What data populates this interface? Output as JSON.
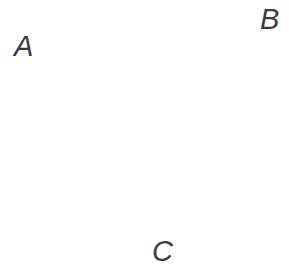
{
  "figure": {
    "type": "geometric-diagram",
    "shape": "triangle",
    "width": 289,
    "height": 279,
    "background_color": "#ffffff",
    "stroke_color": "#3a3a3f",
    "stroke_width": 2.2,
    "label_color": "#3a3a40",
    "label_font_size": 29,
    "label_style": "italic"
  },
  "vertices": {
    "A": {
      "label": "A",
      "x": 38,
      "y": 47
    },
    "B": {
      "label": "B",
      "x": 257,
      "y": 29
    },
    "C": {
      "label": "C",
      "x": 165,
      "y": 233
    }
  },
  "edges": [
    {
      "name": "AB",
      "from": "A",
      "to": "B"
    },
    {
      "name": "BC",
      "from": "B",
      "to": "C"
    },
    {
      "name": "CA",
      "from": "C",
      "to": "A"
    }
  ],
  "polygon_points": "38,47 257,29 165,233",
  "labels": {
    "a": "A",
    "b": "B",
    "c": "C"
  }
}
